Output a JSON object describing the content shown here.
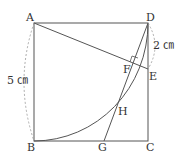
{
  "diagram": {
    "type": "geometry",
    "points": {
      "A": {
        "label": "A",
        "x": 34,
        "y": 23
      },
      "B": {
        "label": "B",
        "x": 34,
        "y": 141
      },
      "C": {
        "label": "C",
        "x": 148,
        "y": 141
      },
      "D": {
        "label": "D",
        "x": 148,
        "y": 23
      },
      "E": {
        "label": "E",
        "x": 148,
        "y": 69
      },
      "F": {
        "label": "F",
        "x": 133,
        "y": 63
      },
      "G": {
        "label": "G",
        "x": 104,
        "y": 141
      },
      "H": {
        "label": "H",
        "x": 117,
        "y": 106
      }
    },
    "measures": {
      "side": "5 ㎝",
      "de": "2 ㎝"
    },
    "colors": {
      "line": "#555555",
      "dashed": "#999999",
      "text": "#333333"
    }
  }
}
